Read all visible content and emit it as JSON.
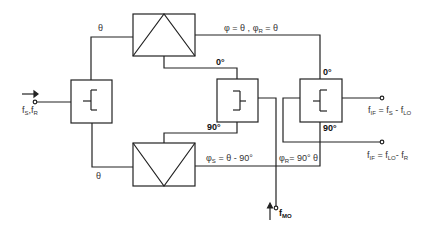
{
  "diagram": {
    "type": "image-rejection mixer block diagram",
    "blocks": [
      {
        "id": "input-hybrid",
        "symbol": "power-splitter"
      },
      {
        "id": "mixer-top",
        "symbol": "mixer-triangle"
      },
      {
        "id": "mixer-bottom",
        "symbol": "mixer-triangle"
      },
      {
        "id": "lo-hybrid",
        "symbol": "quadrature-hybrid"
      },
      {
        "id": "if-hybrid",
        "symbol": "quadrature-hybrid"
      }
    ],
    "labels": {
      "input": "f_S, f_R",
      "input_f": "f",
      "input_s": "S",
      "input_r": "R",
      "theta_top": "θ",
      "theta_bottom": "θ",
      "phase_top_a": "φ = θ ,",
      "phase_top_b": "φ",
      "phase_top_b_sub": "R",
      "phase_top_c": "= θ",
      "lo_hybrid_0": "0°",
      "lo_hybrid_90": "90°",
      "if_hybrid_0": "0°",
      "if_hybrid_90": "90°",
      "phase_bottom_s": "φ",
      "phase_bottom_s_sub": "S",
      "phase_bottom_s_val": "= θ - 90°",
      "phase_bottom_r": "φ",
      "phase_bottom_r_sub": "R",
      "phase_bottom_r_val": "= 90° θ",
      "lo_input": "f",
      "lo_input_sub": "MO",
      "output_upper_f": "f",
      "output_upper_if": "IF",
      "output_upper_eq": "= f",
      "output_upper_s": "S",
      "output_upper_minus": "- f",
      "output_upper_lo": "LO",
      "output_lower_f": "f",
      "output_lower_if": "IF",
      "output_lower_eq": "= f",
      "output_lower_lo": "LO",
      "output_lower_minus": "- f",
      "output_lower_r": "R"
    }
  }
}
